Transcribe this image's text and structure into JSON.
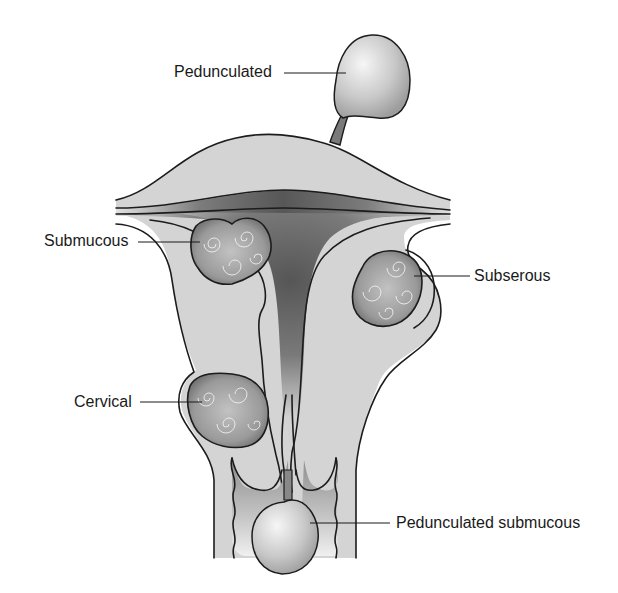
{
  "diagram": {
    "labels": {
      "pedunculated": "Pedunculated",
      "submucous": "Submucous",
      "subserous": "Subserous",
      "cervical": "Cervical",
      "pedunculated_submucous": "Pedunculated submucous"
    },
    "colors": {
      "background": "#ffffff",
      "tissue": "#d4d4d4",
      "cavity": "#5e5e5e",
      "outline": "#1c1c1c",
      "fibroid": "#9a9a9a",
      "polyp": "#c8c8c8",
      "text": "#1a1a1a"
    }
  }
}
